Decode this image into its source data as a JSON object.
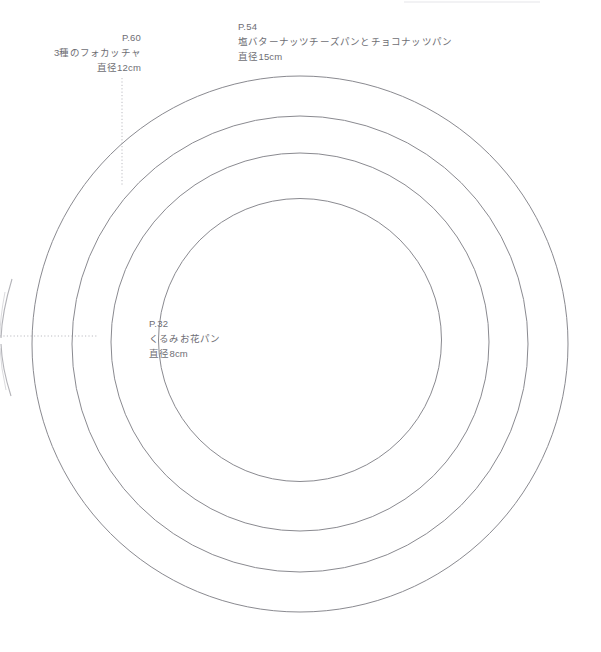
{
  "page": {
    "background_color": "#ffffff",
    "width": 601,
    "height": 652
  },
  "diagram": {
    "type": "concentric-circle-size-template",
    "line_color": "#8a8a90",
    "guide_color": "#b9b9bf",
    "center": {
      "x": 300,
      "y": 344
    },
    "circles": [
      {
        "id": "circle-outer",
        "diameter_px": 536,
        "radius_px": 268,
        "label_ref": "p15"
      },
      {
        "id": "circle-second",
        "diameter_px": 456,
        "radius_px": 228,
        "label_ref": "p12"
      },
      {
        "id": "circle-third",
        "diameter_px": 378,
        "radius_px": 189,
        "label_ref": "none"
      },
      {
        "id": "circle-inner",
        "diameter_px": 283,
        "radius_px": 141.5,
        "label_ref": "p8"
      }
    ],
    "guides": [
      {
        "id": "guide-vertical",
        "orientation": "vertical",
        "x": 122,
        "y_start": 78,
        "y_end": 186,
        "style": "dotted"
      },
      {
        "id": "guide-horizontal",
        "orientation": "horizontal",
        "y": 336,
        "x_start": 0,
        "x_end": 98,
        "style": "dotted"
      }
    ]
  },
  "labels": {
    "p60": {
      "page_ref": "P.60",
      "name": "3種のフォカッチャ",
      "diameter": "直径12cm"
    },
    "p54": {
      "page_ref": "P.54",
      "name": "塩バターナッツチーズパンとチョコナッツパン",
      "diameter": "直径15cm"
    },
    "p32": {
      "page_ref": "P.32",
      "name": "くるみお花パン",
      "diameter": "直径8cm"
    }
  }
}
